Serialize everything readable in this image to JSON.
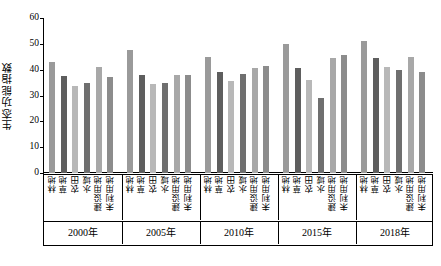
{
  "chart_data": {
    "type": "bar",
    "title": "",
    "subtitle": "",
    "xlabel": "",
    "ylabel": "生态功能指数",
    "ylim": [
      0,
      60
    ],
    "yticks": [
      0,
      10,
      20,
      30,
      40,
      50,
      60
    ],
    "ytick_labels": [
      "0",
      "10",
      "20",
      "30",
      "40",
      "50",
      "60"
    ],
    "grid": false,
    "legend": "none",
    "categories": [
      "林地",
      "草地",
      "农田",
      "水域",
      "建设用地",
      "未利用地"
    ],
    "group_labels": [
      "2000年",
      "2005年",
      "2010年",
      "2015年",
      "2018年"
    ],
    "bar_colors": [
      "#9a9a9a",
      "#5e5e5e",
      "#b8b8b8",
      "#6f6f6f",
      "#a8a8a8",
      "#8c8c8c"
    ],
    "series": [
      {
        "name": "2000年",
        "values": [
          43.0,
          37.5,
          33.5,
          35.0,
          41.0,
          37.0
        ]
      },
      {
        "name": "2005年",
        "values": [
          47.5,
          38.0,
          34.5,
          35.0,
          38.0,
          38.0
        ]
      },
      {
        "name": "2010年",
        "values": [
          45.0,
          39.0,
          35.5,
          38.5,
          40.5,
          41.5
        ]
      },
      {
        "name": "2015年",
        "values": [
          50.0,
          40.5,
          36.0,
          29.0,
          44.5,
          45.5
        ]
      },
      {
        "name": "2018年",
        "values": [
          51.0,
          44.5,
          41.0,
          40.0,
          45.0,
          39.0
        ]
      }
    ]
  }
}
